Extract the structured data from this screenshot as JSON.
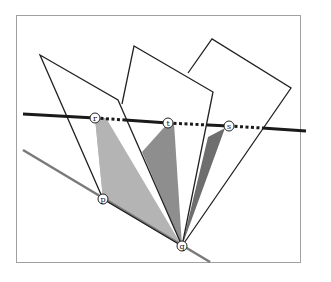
{
  "diagram": {
    "colors": {
      "background": "#ffffff",
      "frame": "#a0a0a0",
      "outline": "#222222",
      "dark_line": "#1a1a1a",
      "gray_line": "#7a7a7a",
      "shade_light": "#b4b4b4",
      "shade_mid": "#8e8e8e",
      "shade_dark": "#6e6e6e"
    },
    "points": {
      "r": {
        "label": "r",
        "x": 95,
        "y": 118
      },
      "t": {
        "label": "t",
        "x": 168,
        "y": 123
      },
      "s": {
        "label": "s",
        "x": 229,
        "y": 126
      },
      "p": {
        "label": "p",
        "x": 103,
        "y": 199
      },
      "q": {
        "label": "q",
        "x": 182,
        "y": 246
      }
    },
    "labels": {
      "r": "r",
      "t": "t",
      "s": "s",
      "p": "p",
      "q": "q"
    }
  }
}
